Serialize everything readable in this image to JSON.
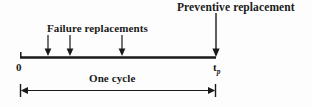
{
  "diagram": {
    "type": "timeline",
    "background_color": "#fdfdfd",
    "line_color": "#1a1a1a",
    "labels": {
      "preventive_replacement": "Preventive replacement",
      "failure_replacements": "Failure replacements",
      "one_cycle": "One cycle",
      "origin": "0",
      "cycle_end": "t",
      "cycle_end_subscript": "p"
    },
    "timeline": {
      "start_x": 20,
      "end_x": 216,
      "y": 57
    },
    "failure_arrows": [
      {
        "x": 48,
        "top_y": 35,
        "tip_y": 55
      },
      {
        "x": 70,
        "top_y": 35,
        "tip_y": 55
      },
      {
        "x": 122,
        "top_y": 35,
        "tip_y": 55
      }
    ],
    "preventive_arrow": {
      "x": 216,
      "top_y": 13,
      "tip_y": 56
    },
    "dimension_line": {
      "y": 90,
      "start_x": 21,
      "end_x": 215
    }
  }
}
